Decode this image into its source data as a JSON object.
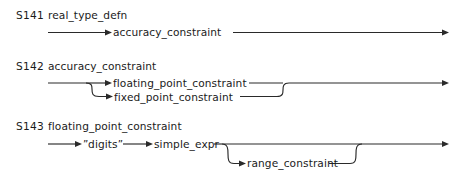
{
  "document": {
    "type": "syntax-railroad-diagram",
    "ink_color": "#2a2a2a",
    "text_color": "#1b1b1b",
    "background_color": "#ffffff"
  },
  "productions": [
    {
      "id": "S141",
      "name": "real_type_defn",
      "elements": [
        {
          "kind": "nonterminal",
          "label": "accuracy_constraint"
        }
      ]
    },
    {
      "id": "S142",
      "name": "accuracy_constraint",
      "elements": [
        {
          "kind": "nonterminal",
          "label": "floating_point_constraint"
        },
        {
          "kind": "nonterminal",
          "label": "fixed_point_constraint"
        }
      ]
    },
    {
      "id": "S143",
      "name": "floating_point_constraint",
      "elements": [
        {
          "kind": "terminal",
          "label": "digits",
          "open_quote": "”",
          "close_quote": "”"
        },
        {
          "kind": "nonterminal",
          "label": "simple_expr"
        },
        {
          "kind": "nonterminal",
          "label": "range_constraint"
        }
      ]
    }
  ],
  "labels": {
    "s141_id": "S141",
    "s141_name": "real_type_defn",
    "s141_accuracy_constraint": "accuracy_constraint",
    "s142_id": "S142",
    "s142_name": "accuracy_constraint",
    "s142_floating_point_constraint": "floating_point_constraint",
    "s142_fixed_point_constraint": "fixed_point_constraint",
    "s143_id": "S143",
    "s143_name": "floating_point_constraint",
    "s143_digits_open_quote": "”",
    "s143_digits": "digits",
    "s143_digits_close_quote": "”",
    "s143_simple_expr": "simple_expr",
    "s143_range_constraint": "range_constraint"
  }
}
